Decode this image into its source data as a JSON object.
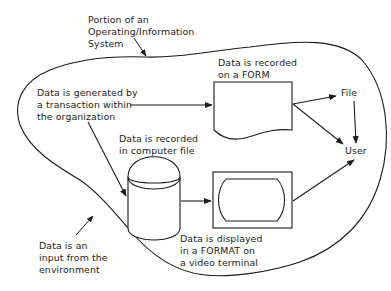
{
  "diagram": {
    "boundary_label": [
      "Portion of an",
      "Operating/Information",
      "System"
    ],
    "transaction_label": [
      "Data is generated by",
      "a transaction within",
      "the organization"
    ],
    "form_label": [
      "Data is recorded",
      "on a FORM"
    ],
    "computer_file_label": [
      "Data is recorded",
      "in computer file"
    ],
    "display_label": [
      "Data is displayed",
      "in a FORMAT on",
      "a video terminal"
    ],
    "environment_label": [
      "Data is an",
      "input from the",
      "environment"
    ],
    "file_node": "File",
    "user_node": "User"
  },
  "nodes": [
    {
      "id": "form",
      "shape": "document",
      "label": "FORM"
    },
    {
      "id": "computer-file",
      "shape": "cylinder",
      "label": "computer file"
    },
    {
      "id": "video-terminal",
      "shape": "display",
      "label": "video terminal"
    },
    {
      "id": "file",
      "shape": "text",
      "label": "File"
    },
    {
      "id": "user",
      "shape": "text",
      "label": "User"
    }
  ],
  "edges": [
    {
      "from": "transaction",
      "to": "form"
    },
    {
      "from": "transaction",
      "to": "computer-file"
    },
    {
      "from": "form",
      "to": "file"
    },
    {
      "from": "form",
      "to": "user"
    },
    {
      "from": "file",
      "to": "user"
    },
    {
      "from": "computer-file",
      "to": "video-terminal"
    },
    {
      "from": "video-terminal",
      "to": "user"
    }
  ],
  "colors": {
    "ink": "#1a1a1a",
    "background": "#ffffff"
  }
}
